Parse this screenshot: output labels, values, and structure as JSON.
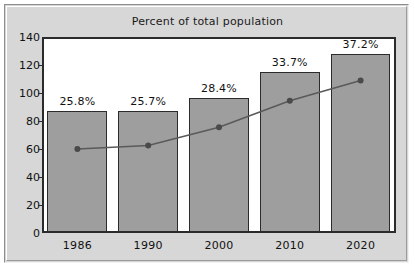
{
  "panel": {
    "background_color": "#d7d7d7",
    "plot_background_color": "#ffffff"
  },
  "chart_data": {
    "type": "bar",
    "title": "Percent of total population",
    "xlabel": "",
    "ylabel": "",
    "categories": [
      "1986",
      "1990",
      "2000",
      "2010",
      "2020"
    ],
    "ylim": [
      0,
      140
    ],
    "yticks": [
      0,
      20,
      40,
      60,
      80,
      100,
      120,
      140
    ],
    "grid": false,
    "legend": "none",
    "bar_color": "#9e9e9e",
    "bar_edge_color": "#2b2b2b",
    "line_color": "#5a5a5a",
    "marker_color": "#4a4a4a",
    "series": [
      {
        "name": "Population count",
        "kind": "bar",
        "values": [
          87,
          87,
          96.5,
          115,
          128
        ]
      },
      {
        "name": "Percent of total population",
        "kind": "line",
        "values": [
          60,
          62.5,
          75.5,
          94.5,
          109
        ]
      }
    ],
    "bar_labels": [
      "25.8%",
      "25.7%",
      "28.4%",
      "33.7%",
      "37.2%"
    ],
    "annotations": [
      {
        "category": "1986",
        "text": "25.8%"
      },
      {
        "category": "1990",
        "text": "25.7%"
      },
      {
        "category": "2000",
        "text": "28.4%"
      },
      {
        "category": "2010",
        "text": "33.7%"
      },
      {
        "category": "2020",
        "text": "37.2%"
      }
    ]
  }
}
